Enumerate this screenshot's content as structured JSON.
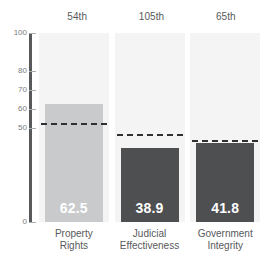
{
  "chart_data": {
    "type": "bar",
    "title": "",
    "subtitle": "",
    "xlabel": "",
    "ylabel": "",
    "ylim": [
      0,
      100
    ],
    "grid": false,
    "legend_position": "none",
    "categories": [
      "Property Rights",
      "Judicial Effectiveness",
      "Government Integrity"
    ],
    "category_lines": [
      [
        "Property",
        "Rights"
      ],
      [
        "Judicial",
        "Effectiveness"
      ],
      [
        "Government",
        "Integrity"
      ]
    ],
    "values": [
      62.5,
      38.9,
      41.8
    ],
    "value_labels": [
      "62.5",
      "38.9",
      "41.8"
    ],
    "ranks": [
      "54th",
      "105th",
      "65th"
    ],
    "series": [
      {
        "name": "Score",
        "values": [
          62.5,
          38.9,
          41.8
        ]
      },
      {
        "name": "World Average",
        "values": [
          51.5,
          45.5,
          42.5
        ],
        "style": "dashed-line"
      }
    ],
    "yticks": [
      0,
      50,
      60,
      70,
      80,
      100
    ],
    "ytick_labels": [
      "0",
      "50",
      "60",
      "70",
      "80",
      "100"
    ],
    "bar_colors": [
      "#c9cacb",
      "#4e4f51",
      "#4e4f51"
    ],
    "average_line_color": "#2f3032",
    "axis_color": "#58595b",
    "band_color": "#f4f4f4",
    "value_label_color": "#ffffff",
    "background_color": "#ffffff"
  }
}
